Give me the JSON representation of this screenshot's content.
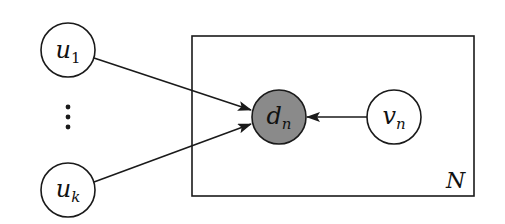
{
  "diagram": {
    "type": "graphical-model-plate",
    "colors": {
      "stroke": "#1a1a1a",
      "observed_fill": "#8a8a8a",
      "latent_fill": "#ffffff",
      "background": "#ffffff"
    },
    "nodes": [
      {
        "id": "u1",
        "base": "u",
        "sub": "1",
        "observed": false
      },
      {
        "id": "uk",
        "base": "u",
        "sub": "k",
        "observed": false
      },
      {
        "id": "dn",
        "base": "d",
        "sub": "n",
        "observed": true
      },
      {
        "id": "vn",
        "base": "v",
        "sub": "n",
        "observed": false
      }
    ],
    "ellipsis": "⋮",
    "edges": [
      {
        "from": "u1",
        "to": "dn"
      },
      {
        "from": "uk",
        "to": "dn"
      },
      {
        "from": "vn",
        "to": "dn"
      }
    ],
    "plate": {
      "label": "N",
      "contains": [
        "dn",
        "vn"
      ]
    }
  }
}
